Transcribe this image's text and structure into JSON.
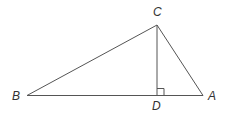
{
  "diagram": {
    "type": "triangle-with-altitude",
    "points": {
      "A": {
        "label": "A",
        "x": 203,
        "y": 95
      },
      "B": {
        "label": "B",
        "x": 27,
        "y": 95
      },
      "C": {
        "label": "C",
        "x": 157,
        "y": 25
      },
      "D": {
        "label": "D",
        "x": 157,
        "y": 95
      }
    },
    "segments": [
      "BC",
      "CA",
      "BA",
      "CD"
    ],
    "right_angle_at": "D",
    "colors": {
      "line": "#555555",
      "label": "#333333"
    }
  }
}
